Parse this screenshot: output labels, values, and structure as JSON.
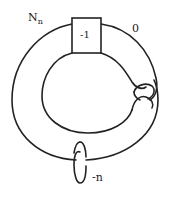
{
  "diagram": {
    "type": "knot-surgery-diagram",
    "labels": {
      "knot_name_main": "N",
      "knot_name_sub": "n",
      "outer_framing": "0",
      "box_twist": "-1",
      "meridian_framing": "-n"
    },
    "components": [
      {
        "name": "knot-Nn",
        "framing": "0",
        "features": [
          "twist box -1",
          "clasp"
        ]
      },
      {
        "name": "meridian-circle",
        "framing": "-n"
      }
    ],
    "colors": {
      "stroke": "#222222",
      "background": "#ffffff"
    }
  }
}
